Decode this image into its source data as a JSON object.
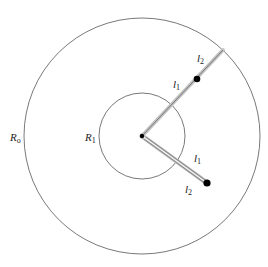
{
  "diagram": {
    "outer_circle": {
      "cx": 142,
      "cy": 136,
      "r": 118,
      "label": "R",
      "label_sub": "o"
    },
    "inner_circle": {
      "cx": 142,
      "cy": 136,
      "r": 43,
      "label": "R",
      "label_sub": "1"
    },
    "center_point": {
      "x": 142,
      "y": 136
    },
    "upper_arm": {
      "end": {
        "x": 223,
        "y": 50
      },
      "dot": {
        "x": 197,
        "y": 79
      },
      "segment1_label": "l",
      "segment1_sub": "1",
      "segment2_label": "l",
      "segment2_sub": "2"
    },
    "lower_arm": {
      "end": {
        "x": 207,
        "y": 183
      },
      "segment1_label": "l",
      "segment1_sub": "1",
      "segment2_label": "l",
      "segment2_sub": "2"
    },
    "colors": {
      "line": "#555555",
      "arm_shadow": "#bbbbbb",
      "dot": "#000000"
    }
  }
}
